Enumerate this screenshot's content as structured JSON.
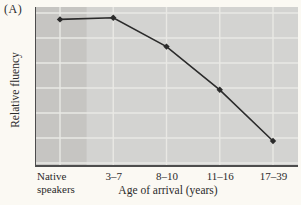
{
  "figure": {
    "panel_label": "(A)",
    "colors": {
      "background": "#fbf9f3",
      "plot_bg": "#d3d3d1",
      "band_bg": "#c6c5c2",
      "gridline": "#e9e8e4",
      "axis": "#4d4d4d",
      "line": "#2b2b2b",
      "text": "#2b2b2b"
    }
  },
  "chart_data": {
    "type": "line",
    "title": "",
    "xlabel": "Age of arrival (years)",
    "ylabel": "Relative fluency",
    "categories": [
      "Native speakers",
      "3–7",
      "8–10",
      "11–16",
      "17–39"
    ],
    "values": [
      0.91,
      0.92,
      0.74,
      0.47,
      0.15
    ],
    "ylim": [
      0,
      1
    ],
    "grid": true,
    "legend": "none",
    "marker": "diamond"
  }
}
